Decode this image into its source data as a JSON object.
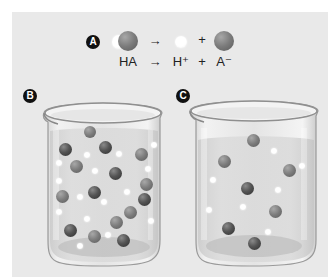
{
  "panel": {
    "background": "#e9e9e9"
  },
  "section_a": {
    "badge": "A",
    "equation_text": {
      "reactant": "HA",
      "arrow": "→",
      "product1": "H⁺",
      "plus": "+",
      "product2": "A⁻"
    },
    "molecules": {
      "reactant": "HA molecule (white H + dark A sphere)",
      "product1": "H+ ion (white sphere)",
      "product2": "A- ion (dark sphere)"
    }
  },
  "beaker_b": {
    "badge": "B",
    "description": "Strong acid: fully dissociated",
    "dark_particles": [
      [
        65,
        148
      ],
      [
        105,
        146
      ],
      [
        113,
        190
      ],
      [
        93,
        224
      ],
      [
        75,
        268
      ],
      [
        125,
        280
      ],
      [
        145,
        236
      ],
      [
        140,
        204
      ]
    ],
    "mid_particles": [
      [
        89,
        131
      ],
      [
        76,
        166
      ],
      [
        138,
        154
      ],
      [
        62,
        196
      ],
      [
        130,
        212
      ],
      [
        116,
        255
      ],
      [
        94,
        276
      ],
      [
        146,
        186
      ]
    ],
    "white_particles": [
      [
        87,
        154
      ],
      [
        119,
        154
      ],
      [
        59,
        163
      ],
      [
        95,
        171
      ],
      [
        59,
        181
      ],
      [
        80,
        197
      ],
      [
        104,
        202
      ],
      [
        127,
        192
      ],
      [
        59,
        212
      ],
      [
        87,
        219
      ],
      [
        153,
        223
      ],
      [
        108,
        235
      ],
      [
        80,
        245
      ],
      [
        150,
        203
      ],
      [
        154,
        144
      ]
    ]
  },
  "beaker_c": {
    "badge": "C",
    "description": "Weak acid: partially dissociated",
    "dark_particles": [
      [
        247,
        188
      ],
      [
        228,
        228
      ],
      [
        254,
        243
      ]
    ],
    "mid_particles": [
      [
        253,
        140
      ],
      [
        224,
        161
      ],
      [
        289,
        170
      ],
      [
        275,
        211
      ]
    ],
    "white_particles": [
      [
        274,
        151
      ],
      [
        302,
        166
      ],
      [
        213,
        180
      ],
      [
        278,
        190
      ],
      [
        243,
        207
      ],
      [
        209,
        210
      ],
      [
        268,
        232
      ]
    ]
  }
}
